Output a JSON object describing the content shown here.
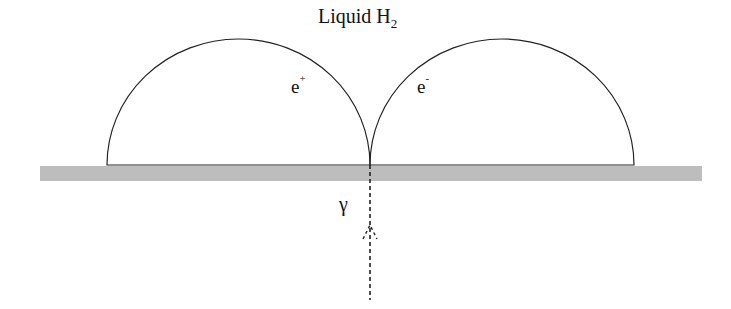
{
  "title": {
    "main": "Liquid H",
    "subscript": "2"
  },
  "labels": {
    "positron": {
      "base": "e",
      "sup": "+"
    },
    "electron": {
      "base": "e",
      "sup": "-"
    },
    "photon": "γ"
  },
  "colors": {
    "line": "#222222",
    "substrate": "#bdbdbd",
    "background": "#ffffff"
  }
}
